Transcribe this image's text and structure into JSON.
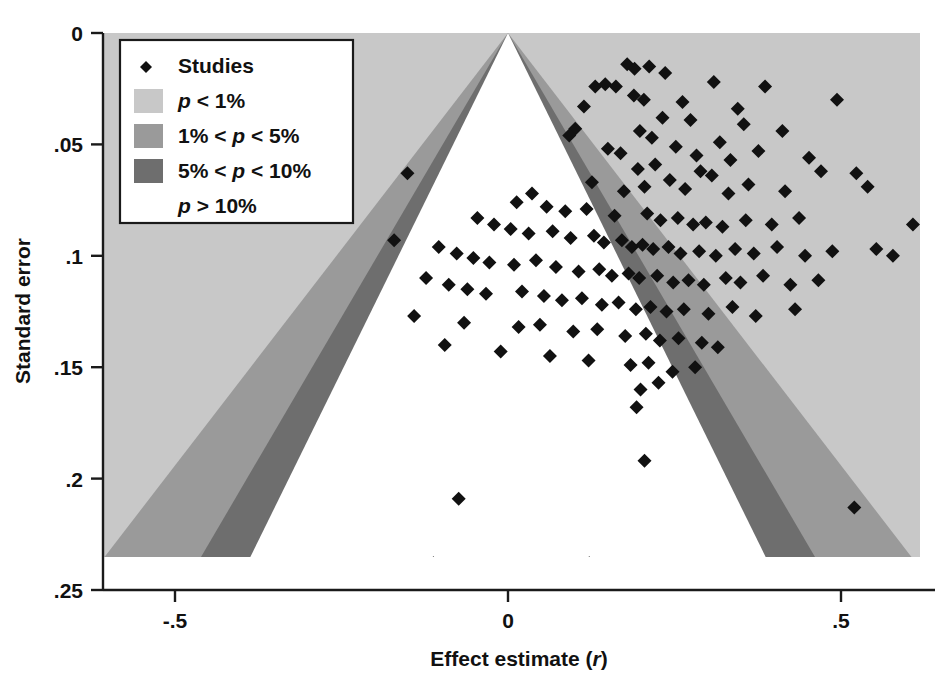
{
  "chart_data": {
    "type": "scatter",
    "title": "",
    "subtitle": "",
    "xlabel": "Effect estimate (r)",
    "ylabel": "Standard error",
    "xlabel_parts": {
      "main": "Effect estimate (",
      "italic": "r",
      "close": ")"
    },
    "xlim": [
      -0.61,
      0.62
    ],
    "ylim": [
      0,
      0.25
    ],
    "y_inverted": true,
    "xticks": [
      -0.5,
      0,
      0.5
    ],
    "xticklabels": [
      "-.5",
      "0",
      ".5"
    ],
    "yticks": [
      0,
      0.05,
      0.1,
      0.15,
      0.2,
      0.25
    ],
    "yticklabels": [
      "0",
      ".05",
      ".1",
      ".15",
      ".2",
      ".25"
    ],
    "grid": false,
    "legend_position": "upper-left",
    "funnel_center": 0.0,
    "funnel_bands": [
      {
        "name": "p > 10%",
        "z": 1.645,
        "color": "#ffffff"
      },
      {
        "name": "5% < p < 10%",
        "z": 1.96,
        "color": "#6e6e6e"
      },
      {
        "name": "1% < p < 5%",
        "z": 2.576,
        "color": "#9a9a9a"
      },
      {
        "name": "p < 1%",
        "z": 99,
        "color": "#c8c8c8"
      }
    ],
    "marker": {
      "shape": "diamond",
      "color": "#111111",
      "size": 7
    },
    "series": [
      {
        "name": "Studies",
        "points": [
          [
            0.179,
            0.014
          ],
          [
            0.19,
            0.016
          ],
          [
            0.212,
            0.015
          ],
          [
            0.236,
            0.018
          ],
          [
            0.131,
            0.024
          ],
          [
            0.146,
            0.023
          ],
          [
            0.162,
            0.024
          ],
          [
            0.189,
            0.028
          ],
          [
            0.204,
            0.03
          ],
          [
            0.114,
            0.033
          ],
          [
            0.309,
            0.022
          ],
          [
            0.386,
            0.024
          ],
          [
            0.262,
            0.031
          ],
          [
            0.345,
            0.034
          ],
          [
            0.494,
            0.03
          ],
          [
            0.232,
            0.038
          ],
          [
            0.101,
            0.043
          ],
          [
            0.092,
            0.046
          ],
          [
            0.274,
            0.039
          ],
          [
            0.198,
            0.044
          ],
          [
            0.216,
            0.047
          ],
          [
            0.354,
            0.041
          ],
          [
            0.412,
            0.044
          ],
          [
            0.318,
            0.049
          ],
          [
            0.15,
            0.052
          ],
          [
            0.169,
            0.054
          ],
          [
            0.252,
            0.051
          ],
          [
            0.283,
            0.055
          ],
          [
            0.334,
            0.057
          ],
          [
            0.376,
            0.053
          ],
          [
            0.452,
            0.056
          ],
          [
            0.221,
            0.059
          ],
          [
            0.195,
            0.061
          ],
          [
            0.289,
            0.062
          ],
          [
            0.306,
            0.064
          ],
          [
            0.243,
            0.066
          ],
          [
            0.47,
            0.062
          ],
          [
            0.523,
            0.063
          ],
          [
            0.126,
            0.067
          ],
          [
            0.205,
            0.069
          ],
          [
            0.174,
            0.071
          ],
          [
            0.266,
            0.07
          ],
          [
            0.331,
            0.072
          ],
          [
            0.361,
            0.068
          ],
          [
            0.416,
            0.071
          ],
          [
            0.54,
            0.069
          ],
          [
            0.036,
            0.072
          ],
          [
            0.013,
            0.076
          ],
          [
            -0.151,
            0.063
          ],
          [
            0.058,
            0.078
          ],
          [
            0.086,
            0.08
          ],
          [
            0.118,
            0.079
          ],
          [
            0.16,
            0.082
          ],
          [
            0.209,
            0.081
          ],
          [
            0.229,
            0.084
          ],
          [
            0.255,
            0.083
          ],
          [
            0.278,
            0.086
          ],
          [
            0.297,
            0.085
          ],
          [
            0.322,
            0.087
          ],
          [
            0.357,
            0.084
          ],
          [
            0.396,
            0.086
          ],
          [
            0.437,
            0.083
          ],
          [
            0.608,
            0.086
          ],
          [
            -0.046,
            0.083
          ],
          [
            -0.021,
            0.086
          ],
          [
            0.004,
            0.088
          ],
          [
            0.031,
            0.09
          ],
          [
            0.067,
            0.089
          ],
          [
            0.094,
            0.092
          ],
          [
            0.129,
            0.091
          ],
          [
            0.144,
            0.094
          ],
          [
            0.171,
            0.093
          ],
          [
            0.186,
            0.096
          ],
          [
            0.202,
            0.095
          ],
          [
            0.218,
            0.097
          ],
          [
            0.241,
            0.096
          ],
          [
            0.259,
            0.099
          ],
          [
            0.287,
            0.098
          ],
          [
            0.312,
            0.1
          ],
          [
            0.341,
            0.097
          ],
          [
            0.369,
            0.099
          ],
          [
            0.404,
            0.096
          ],
          [
            0.446,
            0.1
          ],
          [
            0.487,
            0.098
          ],
          [
            0.553,
            0.097
          ],
          [
            0.578,
            0.1
          ],
          [
            -0.171,
            0.093
          ],
          [
            -0.104,
            0.096
          ],
          [
            -0.077,
            0.099
          ],
          [
            -0.052,
            0.101
          ],
          [
            -0.028,
            0.103
          ],
          [
            0.009,
            0.104
          ],
          [
            0.042,
            0.102
          ],
          [
            0.072,
            0.105
          ],
          [
            0.106,
            0.107
          ],
          [
            0.137,
            0.106
          ],
          [
            0.156,
            0.109
          ],
          [
            0.181,
            0.108
          ],
          [
            0.197,
            0.11
          ],
          [
            0.224,
            0.109
          ],
          [
            0.248,
            0.112
          ],
          [
            0.271,
            0.111
          ],
          [
            0.294,
            0.113
          ],
          [
            0.327,
            0.11
          ],
          [
            0.349,
            0.112
          ],
          [
            0.383,
            0.109
          ],
          [
            0.424,
            0.113
          ],
          [
            0.466,
            0.111
          ],
          [
            -0.123,
            0.11
          ],
          [
            -0.089,
            0.113
          ],
          [
            -0.061,
            0.115
          ],
          [
            -0.033,
            0.117
          ],
          [
            0.021,
            0.116
          ],
          [
            0.054,
            0.118
          ],
          [
            0.081,
            0.12
          ],
          [
            0.111,
            0.119
          ],
          [
            0.141,
            0.122
          ],
          [
            0.166,
            0.121
          ],
          [
            0.192,
            0.124
          ],
          [
            0.214,
            0.123
          ],
          [
            0.238,
            0.125
          ],
          [
            0.264,
            0.124
          ],
          [
            0.301,
            0.126
          ],
          [
            0.337,
            0.123
          ],
          [
            0.372,
            0.127
          ],
          [
            0.431,
            0.124
          ],
          [
            -0.141,
            0.127
          ],
          [
            -0.066,
            0.13
          ],
          [
            0.016,
            0.132
          ],
          [
            0.048,
            0.131
          ],
          [
            0.098,
            0.134
          ],
          [
            0.134,
            0.133
          ],
          [
            0.176,
            0.136
          ],
          [
            0.207,
            0.135
          ],
          [
            0.228,
            0.138
          ],
          [
            0.256,
            0.137
          ],
          [
            0.291,
            0.139
          ],
          [
            0.315,
            0.141
          ],
          [
            -0.095,
            0.14
          ],
          [
            -0.011,
            0.143
          ],
          [
            0.063,
            0.145
          ],
          [
            0.121,
            0.147
          ],
          [
            0.184,
            0.149
          ],
          [
            0.211,
            0.148
          ],
          [
            0.247,
            0.152
          ],
          [
            0.281,
            0.15
          ],
          [
            0.199,
            0.16
          ],
          [
            0.226,
            0.157
          ],
          [
            0.193,
            0.168
          ],
          [
            0.205,
            0.192
          ],
          [
            -0.074,
            0.209
          ],
          [
            0.52,
            0.213
          ],
          [
            -0.112,
            0.238
          ],
          [
            0.122,
            0.238
          ]
        ]
      }
    ]
  },
  "legend": {
    "box": true,
    "entries": [
      {
        "type": "marker",
        "label": "Studies",
        "italic_label": "",
        "swatch": "#111111"
      },
      {
        "type": "swatch",
        "label": " < 1%",
        "italic_label": "p",
        "swatch": "#c8c8c8"
      },
      {
        "type": "swatch",
        "label_pre": "1% < ",
        "italic_label": "p",
        "label": " < 5%",
        "swatch": "#9a9a9a"
      },
      {
        "type": "swatch",
        "label_pre": "5% < ",
        "italic_label": "p",
        "label": " < 10%",
        "swatch": "#6e6e6e"
      },
      {
        "type": "none",
        "label": " > 10%",
        "italic_label": "p",
        "swatch": "#ffffff"
      }
    ]
  },
  "colors": {
    "band_p_lt_1": "#c8c8c8",
    "band_p_1_5": "#9a9a9a",
    "band_p_5_10": "#6e6e6e",
    "band_p_gt_10": "#ffffff",
    "marker": "#111111",
    "axis": "#1a1a1a",
    "background": "#ffffff"
  }
}
